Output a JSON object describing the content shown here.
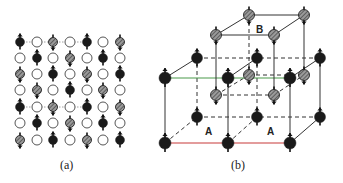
{
  "figure": {
    "panels": [
      {
        "id": "a",
        "caption": "(a)",
        "description": "2D square lattice of spins: black (spin up), hatched (spin down), open circles (non-magnetic)",
        "grid": {
          "cols": [
            20,
            37,
            53,
            70,
            87,
            103,
            120
          ],
          "rows": [
            42,
            58,
            74,
            90,
            107,
            123,
            140
          ],
          "cells": [
            [
              "B",
              "O",
              "H",
              "O",
              "B",
              "O",
              "H"
            ],
            [
              "O",
              "B",
              "O",
              "H",
              "O",
              "B",
              "O"
            ],
            [
              "H",
              "O",
              "B",
              "O",
              "H",
              "O",
              "B"
            ],
            [
              "O",
              "H",
              "O",
              "B",
              "O",
              "H",
              "O"
            ],
            [
              "B",
              "O",
              "H",
              "O",
              "B",
              "O",
              "H"
            ],
            [
              "O",
              "B",
              "O",
              "H",
              "O",
              "B",
              "O"
            ],
            [
              "H",
              "O",
              "B",
              "O",
              "H",
              "O",
              "B"
            ]
          ],
          "dotted_rows": [
            0,
            4
          ],
          "legend": {
            "B": "black spin-up atom",
            "H": "hatched spin-down atom",
            "O": "open circle"
          }
        }
      },
      {
        "id": "b",
        "caption": "(b)",
        "labels": [
          {
            "text": "B",
            "x": 256,
            "y": 33
          },
          {
            "text": "A",
            "x": 205,
            "y": 135
          },
          {
            "text": "A",
            "x": 267,
            "y": 135
          }
        ],
        "colors": {
          "black_atom": "#1a1a1a",
          "hatched_atom": "#888888",
          "green_edge": "#4a9a4a",
          "red_edge": "#c83a3a",
          "line": "#333333"
        }
      }
    ]
  }
}
